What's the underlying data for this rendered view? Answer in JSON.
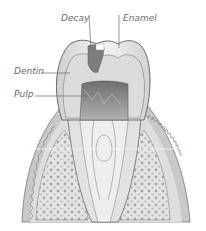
{
  "diagram": {
    "type": "tooth cross-section illustration",
    "labels": [
      {
        "id": "decay",
        "text": "Decay"
      },
      {
        "id": "enamel",
        "text": "Enamel"
      },
      {
        "id": "dentin",
        "text": "Dentin"
      },
      {
        "id": "pulp",
        "text": "Pulp"
      }
    ],
    "colors": {
      "background": "#ffffff",
      "label_text": "#6a6a6a",
      "enamel": "#ececec",
      "dentin": "#dcdcdc",
      "pulp": "#8a8a8a",
      "decay": "#7c7c7c",
      "bone": "#e6e6e6",
      "bone_dots": "#a8a8a8",
      "gum": "#bdbdbd",
      "outline": "#5e5e5e"
    }
  }
}
